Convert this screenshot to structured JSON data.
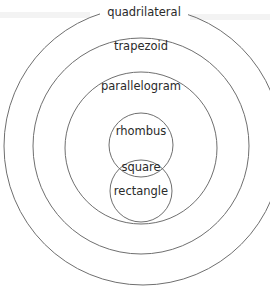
{
  "diagram": {
    "sets": [
      {
        "id": "quadrilateral",
        "label": "quadrilateral",
        "parent": null
      },
      {
        "id": "trapezoid",
        "label": "trapezoid",
        "parent": "quadrilateral"
      },
      {
        "id": "parallelogram",
        "label": "parallelogram",
        "parent": "trapezoid"
      },
      {
        "id": "rhombus",
        "label": "rhombus",
        "parent": "parallelogram"
      },
      {
        "id": "rectangle",
        "label": "rectangle",
        "parent": "parallelogram"
      },
      {
        "id": "square",
        "label": "square",
        "intersection_of": [
          "rhombus",
          "rectangle"
        ]
      }
    ],
    "colors": {
      "stroke": "#6f6f6f",
      "text": "#2a2a2a",
      "background": "#ffffff"
    }
  }
}
